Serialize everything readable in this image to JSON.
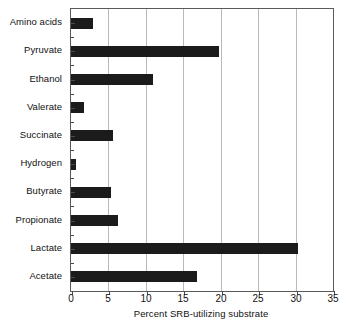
{
  "chart_data": {
    "type": "bar",
    "orientation": "horizontal",
    "title": "",
    "xlabel": "Percent SRB-utilizing substrate",
    "ylabel": "",
    "xlim": [
      0,
      35
    ],
    "ylim": null,
    "grid": "vertical",
    "legend": "none",
    "xticks": [
      0,
      5,
      10,
      15,
      20,
      25,
      30,
      35
    ],
    "xticklabels": [
      "0",
      "5",
      "10",
      "15",
      "20",
      "25",
      "30",
      "35"
    ],
    "categories": [
      "Amino acids",
      "Pyruvate",
      "Ethanol",
      "Valerate",
      "Succinate",
      "Hydrogen",
      "Butyrate",
      "Propionate",
      "Lactate",
      "Acetate"
    ],
    "values": [
      3.0,
      19.8,
      11.0,
      1.8,
      5.6,
      0.7,
      5.3,
      6.3,
      30.3,
      16.8
    ],
    "bar_color": "#1b1b1b",
    "grid_color": "#b9b9b9",
    "frame_color": "#5a5a5a",
    "background": "#ffffff"
  }
}
